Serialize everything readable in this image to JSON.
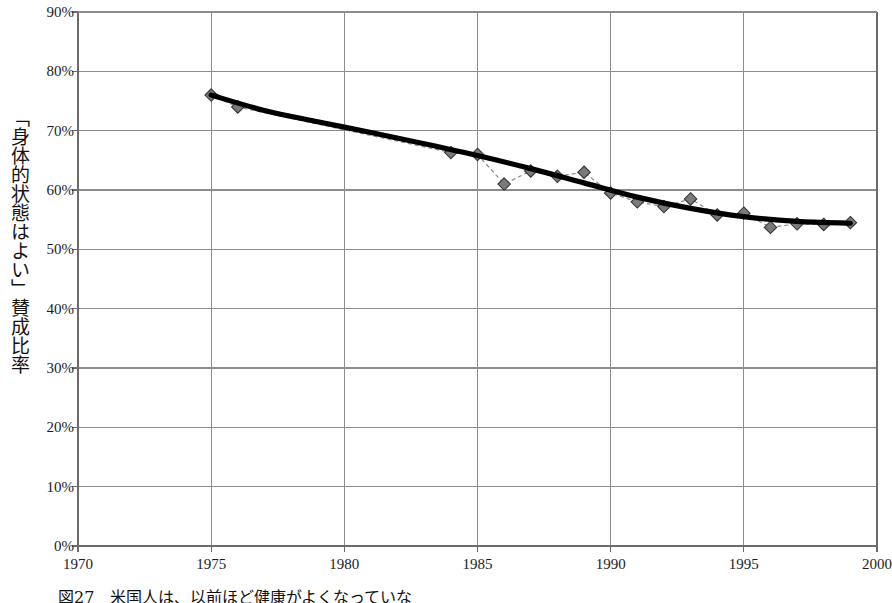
{
  "chart_data": {
    "type": "line",
    "title": "",
    "subtitle": "",
    "xlabel": "",
    "ylabel": "「身体的状態はよい」賛成比率",
    "xlim": [
      1970,
      2000
    ],
    "ylim": [
      0,
      90
    ],
    "y_tick_labels": [
      "0%",
      "10%",
      "20%",
      "30%",
      "40%",
      "50%",
      "60%",
      "70%",
      "80%",
      "90%"
    ],
    "y_ticks": [
      0,
      10,
      20,
      30,
      40,
      50,
      60,
      70,
      80,
      90
    ],
    "x_tick_labels": [
      "1970",
      "1975",
      "1980",
      "1985",
      "1990",
      "1995",
      "2000"
    ],
    "x_ticks": [
      1970,
      1975,
      1980,
      1985,
      1990,
      1995,
      2000
    ],
    "grid": "both",
    "legend": "none",
    "series": [
      {
        "name": "observed",
        "style": "dashed-with-diamond-markers",
        "color": "#6e6e6e",
        "x": [
          1975,
          1976,
          1984,
          1985,
          1986,
          1987,
          1988,
          1989,
          1990,
          1991,
          1992,
          1993,
          1994,
          1995,
          1996,
          1997,
          1998,
          1999
        ],
        "values": [
          76.0,
          74.0,
          66.3,
          66.0,
          61.0,
          63.2,
          62.3,
          63.0,
          59.5,
          58.0,
          57.2,
          58.5,
          55.8,
          56.1,
          53.7,
          54.3,
          54.2,
          54.5
        ]
      },
      {
        "name": "trend",
        "style": "thick-solid-smooth",
        "color": "#000000",
        "x": [
          1975,
          1977,
          1979,
          1981,
          1983,
          1985,
          1987,
          1989,
          1991,
          1993,
          1995,
          1997,
          1999
        ],
        "values": [
          76.0,
          73.4,
          71.5,
          69.7,
          67.8,
          65.8,
          63.6,
          61.2,
          58.8,
          56.9,
          55.5,
          54.7,
          54.4
        ]
      }
    ],
    "colors": {
      "grid": "#8c8c8c",
      "axis": "#6b6b6b",
      "marker_fill": "#7a7a7a",
      "marker_stroke": "#333333",
      "trend": "#000000",
      "connector": "#8a8a8a",
      "text": "#1a1a1a"
    }
  },
  "caption": {
    "text": "図27　米国人は、以前ほど健康がよくなっていな"
  },
  "axis_titles": {
    "y": "「身体的状態はよい」賛成比率"
  }
}
